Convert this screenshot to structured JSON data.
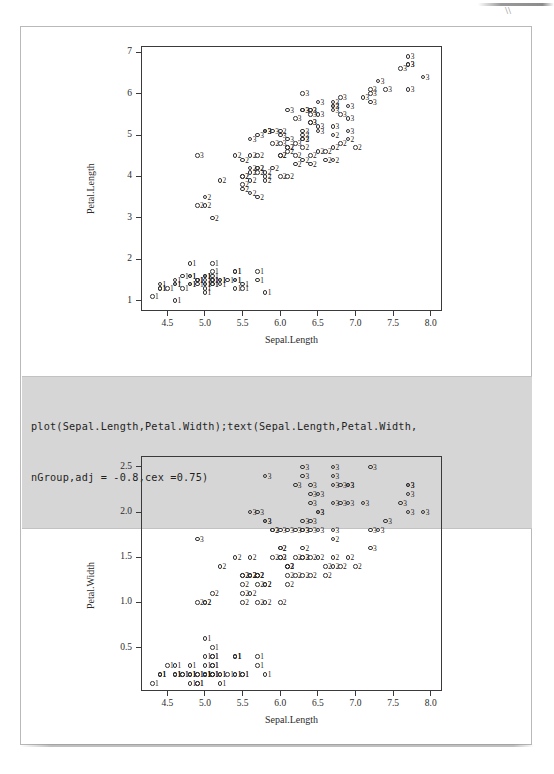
{
  "page": {
    "type": "scanned-document-page",
    "background": "#ffffff",
    "frame_color": "#b9b9b9"
  },
  "code_block": {
    "name": "r-code-snippet",
    "background": "#d6d6d6",
    "lines": [
      "plot(Sepal.Length,Petal.Width);text(Sepal.Length,Petal.Width,",
      "nGroup,adj = -0.8,cex =0.75)"
    ]
  },
  "chart_data": [
    {
      "id": "chart-petal-length",
      "type": "scatter",
      "title": "",
      "xlabel": "Sepal.Length",
      "ylabel": "Petal.Length",
      "xlim": [
        4.15,
        8.15
      ],
      "ylim": [
        0.75,
        7.15
      ],
      "xticks": [
        4.5,
        5.0,
        5.5,
        6.0,
        6.5,
        7.0,
        7.5,
        8.0
      ],
      "xtick_labels": [
        "4.5",
        "5.0",
        "5.5",
        "6.0",
        "6.5",
        "7.0",
        "7.5",
        "8.0"
      ],
      "yticks": [
        1,
        2,
        3,
        4,
        5,
        6,
        7
      ],
      "ytick_labels": [
        "1",
        "2",
        "3",
        "4",
        "5",
        "6",
        "7"
      ],
      "grid": false,
      "legend": "none",
      "marker": "open-circle",
      "point_label_field": "nGroup",
      "series": [
        {
          "name": "nGroup",
          "x": [
            5.1,
            4.9,
            4.7,
            4.6,
            5.0,
            5.4,
            4.6,
            5.0,
            4.4,
            4.9,
            5.4,
            4.8,
            4.8,
            4.3,
            5.8,
            5.7,
            5.4,
            5.1,
            5.7,
            5.1,
            5.4,
            5.1,
            4.6,
            5.1,
            4.8,
            5.0,
            5.0,
            5.2,
            5.2,
            4.7,
            4.8,
            5.4,
            5.2,
            5.5,
            4.9,
            5.0,
            5.5,
            4.9,
            4.4,
            5.1,
            5.0,
            4.5,
            4.4,
            5.0,
            5.1,
            4.8,
            5.1,
            4.6,
            5.3,
            5.0,
            7.0,
            6.4,
            6.9,
            5.5,
            6.5,
            5.7,
            6.3,
            4.9,
            6.6,
            5.2,
            5.0,
            5.9,
            6.0,
            6.1,
            5.6,
            6.7,
            5.6,
            5.8,
            6.2,
            5.6,
            5.9,
            6.1,
            6.3,
            6.1,
            6.4,
            6.6,
            6.8,
            6.7,
            6.0,
            5.7,
            5.5,
            5.5,
            5.8,
            6.0,
            5.4,
            6.0,
            6.7,
            6.3,
            5.6,
            5.5,
            5.5,
            6.1,
            5.8,
            5.0,
            5.6,
            5.7,
            5.7,
            6.2,
            5.1,
            5.7,
            6.3,
            5.8,
            7.1,
            6.3,
            6.5,
            7.6,
            4.9,
            7.3,
            6.7,
            7.2,
            6.5,
            6.4,
            6.8,
            5.7,
            5.8,
            6.4,
            6.5,
            7.7,
            7.7,
            6.0,
            6.9,
            5.6,
            7.7,
            6.3,
            6.7,
            7.2,
            6.2,
            6.1,
            6.4,
            7.2,
            7.4,
            7.9,
            6.4,
            6.3,
            6.1,
            7.7,
            6.3,
            6.4,
            6.0,
            6.9,
            6.7,
            6.9,
            5.8,
            6.8,
            6.7,
            6.7,
            6.3,
            6.5,
            6.2,
            5.9
          ],
          "y": [
            1.4,
            1.4,
            1.3,
            1.5,
            1.4,
            1.7,
            1.4,
            1.5,
            1.4,
            1.5,
            1.5,
            1.6,
            1.4,
            1.1,
            1.2,
            1.5,
            1.3,
            1.4,
            1.7,
            1.5,
            1.7,
            1.5,
            1.0,
            1.7,
            1.9,
            1.6,
            1.6,
            1.5,
            1.4,
            1.6,
            1.6,
            1.5,
            1.5,
            1.4,
            1.5,
            1.2,
            1.3,
            1.5,
            1.3,
            1.5,
            1.3,
            1.3,
            1.3,
            1.6,
            1.9,
            1.4,
            1.6,
            1.4,
            1.5,
            1.4,
            4.7,
            4.5,
            4.9,
            4.0,
            4.6,
            4.5,
            4.7,
            3.3,
            4.6,
            3.9,
            3.5,
            4.2,
            4.0,
            4.7,
            3.6,
            4.4,
            4.5,
            4.1,
            4.5,
            3.9,
            4.8,
            4.0,
            4.9,
            4.7,
            4.3,
            4.4,
            4.8,
            5.0,
            4.5,
            3.5,
            3.8,
            3.7,
            3.9,
            5.1,
            4.5,
            4.5,
            4.7,
            4.4,
            4.1,
            4.0,
            4.4,
            4.6,
            4.0,
            3.3,
            4.2,
            4.2,
            4.2,
            4.3,
            3.0,
            4.1,
            6.0,
            5.1,
            5.9,
            5.6,
            5.8,
            6.6,
            4.5,
            6.3,
            5.8,
            6.1,
            5.1,
            5.3,
            5.5,
            5.0,
            5.1,
            5.3,
            5.5,
            6.7,
            6.9,
            5.0,
            5.7,
            4.9,
            6.7,
            4.9,
            5.7,
            6.0,
            4.8,
            4.9,
            5.6,
            5.8,
            6.1,
            6.4,
            5.6,
            5.1,
            5.6,
            6.1,
            5.6,
            5.5,
            4.8,
            5.4,
            5.6,
            5.1,
            5.1,
            5.9,
            5.7,
            5.2,
            5.0,
            5.2,
            5.4,
            5.1
          ],
          "labels": [
            "1",
            "1",
            "1",
            "1",
            "1",
            "1",
            "1",
            "1",
            "1",
            "1",
            "1",
            "1",
            "1",
            "1",
            "1",
            "1",
            "1",
            "1",
            "1",
            "1",
            "1",
            "1",
            "1",
            "1",
            "1",
            "1",
            "1",
            "1",
            "1",
            "1",
            "1",
            "1",
            "1",
            "1",
            "1",
            "1",
            "1",
            "1",
            "1",
            "1",
            "1",
            "1",
            "1",
            "1",
            "1",
            "1",
            "1",
            "1",
            "1",
            "1",
            "2",
            "2",
            "2",
            "2",
            "2",
            "2",
            "2",
            "2",
            "2",
            "2",
            "2",
            "2",
            "2",
            "2",
            "2",
            "2",
            "2",
            "2",
            "2",
            "2",
            "2",
            "2",
            "2",
            "2",
            "2",
            "2",
            "2",
            "2",
            "2",
            "2",
            "2",
            "2",
            "2",
            "2",
            "2",
            "2",
            "2",
            "2",
            "2",
            "2",
            "2",
            "2",
            "2",
            "2",
            "2",
            "2",
            "2",
            "2",
            "2",
            "2",
            "3",
            "3",
            "3",
            "3",
            "3",
            "3",
            "3",
            "3",
            "3",
            "3",
            "3",
            "3",
            "3",
            "3",
            "3",
            "3",
            "3",
            "3",
            "3",
            "3",
            "3",
            "3",
            "3",
            "3",
            "3",
            "3",
            "3",
            "3",
            "3",
            "3",
            "3",
            "3",
            "3",
            "3",
            "3",
            "3",
            "3",
            "3",
            "3",
            "3",
            "3",
            "3",
            "3",
            "3",
            "3",
            "3",
            "3",
            "3",
            "3",
            "3"
          ]
        }
      ]
    },
    {
      "id": "chart-petal-width",
      "type": "scatter",
      "title": "",
      "xlabel": "Sepal.Length",
      "ylabel": "Petal.Width",
      "xlim": [
        4.15,
        8.15
      ],
      "ylim": [
        0.02,
        2.62
      ],
      "xticks": [
        4.5,
        5.0,
        5.5,
        6.0,
        6.5,
        7.0,
        7.5,
        8.0
      ],
      "xtick_labels": [
        "4.5",
        "5.0",
        "5.5",
        "6.0",
        "6.5",
        "7.0",
        "7.5",
        "8.0"
      ],
      "yticks": [
        0.5,
        1.0,
        1.5,
        2.0,
        2.5
      ],
      "ytick_labels": [
        "0.5",
        "1.0",
        "1.5",
        "2.0",
        "2.5"
      ],
      "grid": false,
      "legend": "none",
      "marker": "open-circle",
      "point_label_field": "nGroup",
      "series": [
        {
          "name": "nGroup",
          "x": [
            5.1,
            4.9,
            4.7,
            4.6,
            5.0,
            5.4,
            4.6,
            5.0,
            4.4,
            4.9,
            5.4,
            4.8,
            4.8,
            4.3,
            5.8,
            5.7,
            5.4,
            5.1,
            5.7,
            5.1,
            5.4,
            5.1,
            4.6,
            5.1,
            4.8,
            5.0,
            5.0,
            5.2,
            5.2,
            4.7,
            4.8,
            5.4,
            5.2,
            5.5,
            4.9,
            5.0,
            5.5,
            4.9,
            4.4,
            5.1,
            5.0,
            4.5,
            4.4,
            5.0,
            5.1,
            4.8,
            5.1,
            4.6,
            5.3,
            5.0,
            7.0,
            6.4,
            6.9,
            5.5,
            6.5,
            5.7,
            6.3,
            4.9,
            6.6,
            5.2,
            5.0,
            5.9,
            6.0,
            6.1,
            5.6,
            6.7,
            5.6,
            5.8,
            6.2,
            5.6,
            5.9,
            6.1,
            6.3,
            6.1,
            6.4,
            6.6,
            6.8,
            6.7,
            6.0,
            5.7,
            5.5,
            5.5,
            5.8,
            6.0,
            5.4,
            6.0,
            6.7,
            6.3,
            5.6,
            5.5,
            5.5,
            6.1,
            5.8,
            5.0,
            5.6,
            5.7,
            5.7,
            6.2,
            5.1,
            5.7,
            6.3,
            5.8,
            7.1,
            6.3,
            6.5,
            7.6,
            4.9,
            7.3,
            6.7,
            7.2,
            6.5,
            6.4,
            6.8,
            5.7,
            5.8,
            6.4,
            6.5,
            7.7,
            7.7,
            6.0,
            6.9,
            5.6,
            7.7,
            6.3,
            6.7,
            7.2,
            6.2,
            6.1,
            6.4,
            7.2,
            7.4,
            7.9,
            6.4,
            6.3,
            6.1,
            7.7,
            6.3,
            6.4,
            6.0,
            6.9,
            6.7,
            6.9,
            5.8,
            6.8,
            6.7,
            6.7,
            6.3,
            6.5,
            6.2,
            5.9
          ],
          "y": [
            0.2,
            0.2,
            0.2,
            0.2,
            0.2,
            0.4,
            0.3,
            0.2,
            0.2,
            0.1,
            0.2,
            0.2,
            0.1,
            0.1,
            0.2,
            0.4,
            0.4,
            0.3,
            0.3,
            0.3,
            0.2,
            0.4,
            0.2,
            0.5,
            0.2,
            0.2,
            0.4,
            0.2,
            0.2,
            0.2,
            0.2,
            0.4,
            0.1,
            0.2,
            0.2,
            0.2,
            0.2,
            0.1,
            0.2,
            0.2,
            0.3,
            0.3,
            0.2,
            0.6,
            0.4,
            0.3,
            0.2,
            0.2,
            0.2,
            0.2,
            1.4,
            1.5,
            1.5,
            1.3,
            1.5,
            1.3,
            1.6,
            1.0,
            1.3,
            1.4,
            1.0,
            1.5,
            1.0,
            1.4,
            1.3,
            1.4,
            1.5,
            1.0,
            1.5,
            1.1,
            1.8,
            1.3,
            1.5,
            1.2,
            1.3,
            1.4,
            1.4,
            1.7,
            1.5,
            1.0,
            1.1,
            1.0,
            1.2,
            1.6,
            1.5,
            1.6,
            1.5,
            1.3,
            1.3,
            1.3,
            1.2,
            1.4,
            1.2,
            1.0,
            1.3,
            1.2,
            1.3,
            1.3,
            1.1,
            1.3,
            2.5,
            1.9,
            2.1,
            1.8,
            2.2,
            2.1,
            1.7,
            1.8,
            1.8,
            2.5,
            2.0,
            1.9,
            2.1,
            2.0,
            2.4,
            2.3,
            1.8,
            2.2,
            2.3,
            1.5,
            2.3,
            2.0,
            2.0,
            1.8,
            2.1,
            1.8,
            1.8,
            1.8,
            2.1,
            1.6,
            1.9,
            2.0,
            2.2,
            1.5,
            1.4,
            2.3,
            2.4,
            1.8,
            1.8,
            2.1,
            2.4,
            2.3,
            1.9,
            2.3,
            2.5,
            2.3,
            1.9,
            2.0,
            2.3,
            1.8
          ],
          "labels": [
            "1",
            "1",
            "1",
            "1",
            "1",
            "1",
            "1",
            "1",
            "1",
            "1",
            "1",
            "1",
            "1",
            "1",
            "1",
            "1",
            "1",
            "1",
            "1",
            "1",
            "1",
            "1",
            "1",
            "1",
            "1",
            "1",
            "1",
            "1",
            "1",
            "1",
            "1",
            "1",
            "1",
            "1",
            "1",
            "1",
            "1",
            "1",
            "1",
            "1",
            "1",
            "1",
            "1",
            "1",
            "1",
            "1",
            "1",
            "1",
            "1",
            "1",
            "2",
            "2",
            "2",
            "2",
            "2",
            "2",
            "2",
            "2",
            "2",
            "2",
            "2",
            "2",
            "2",
            "2",
            "2",
            "2",
            "2",
            "2",
            "2",
            "2",
            "2",
            "2",
            "2",
            "2",
            "2",
            "2",
            "2",
            "2",
            "2",
            "2",
            "2",
            "2",
            "2",
            "2",
            "2",
            "2",
            "2",
            "2",
            "2",
            "2",
            "2",
            "2",
            "2",
            "2",
            "2",
            "2",
            "2",
            "2",
            "2",
            "2",
            "3",
            "3",
            "3",
            "3",
            "3",
            "3",
            "3",
            "3",
            "3",
            "3",
            "3",
            "3",
            "3",
            "3",
            "3",
            "3",
            "3",
            "3",
            "3",
            "3",
            "3",
            "3",
            "3",
            "3",
            "3",
            "3",
            "3",
            "3",
            "3",
            "3",
            "3",
            "3",
            "3",
            "3",
            "3",
            "3",
            "3",
            "3",
            "3",
            "3",
            "3",
            "3",
            "3",
            "3",
            "3",
            "3",
            "3",
            "3",
            "3",
            "3"
          ]
        }
      ]
    }
  ]
}
